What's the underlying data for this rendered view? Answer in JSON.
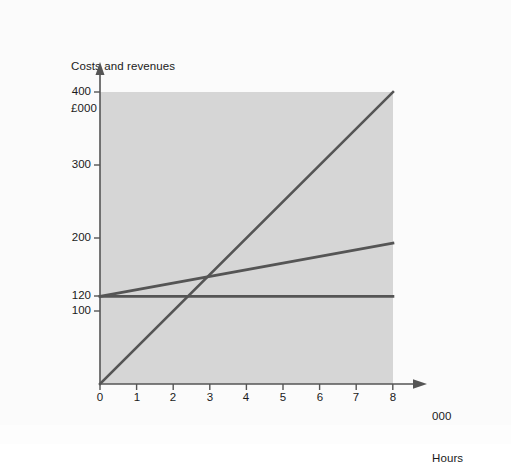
{
  "figure": {
    "background_color": "#fbfbfb",
    "plot_fill_color": "#d6d6d6",
    "line_color": "#555555",
    "axis_color": "#555555",
    "text_color": "#1a1a1a"
  },
  "axis_titles": {
    "y_line1": "Costs and revenues",
    "y_line2": "£000",
    "x_line1": "000",
    "x_line2": "Hours"
  },
  "y_ticks": [
    {
      "label": "400",
      "value": 400
    },
    {
      "label": "300",
      "value": 300
    },
    {
      "label": "200",
      "value": 200
    },
    {
      "label": "120",
      "value": 120
    },
    {
      "label": "100",
      "value": 100
    }
  ],
  "x_ticks": [
    {
      "label": "0",
      "value": 0
    },
    {
      "label": "1",
      "value": 1
    },
    {
      "label": "2",
      "value": 2
    },
    {
      "label": "3",
      "value": 3
    },
    {
      "label": "4",
      "value": 4
    },
    {
      "label": "5",
      "value": 5
    },
    {
      "label": "6",
      "value": 6
    },
    {
      "label": "7",
      "value": 7
    },
    {
      "label": "8",
      "value": 8
    }
  ],
  "chart_data": {
    "type": "line",
    "title": "",
    "subtitle": "",
    "xlabel": "000 Hours",
    "ylabel": "Costs and revenues £000",
    "xlim": [
      0,
      8
    ],
    "ylim": [
      0,
      400
    ],
    "grid": false,
    "legend": "none",
    "shaded_plot_region": {
      "x_range": [
        0,
        8
      ],
      "y_range": [
        0,
        400
      ],
      "color": "#d6d6d6"
    },
    "x": [
      0,
      8
    ],
    "series": [
      {
        "name": "Sales revenue",
        "values": [
          0,
          400
        ],
        "points": [
          [
            0,
            0
          ],
          [
            8,
            400
          ]
        ],
        "slope_per_unit": 50,
        "intercept": 0,
        "color": "#555555"
      },
      {
        "name": "Total cost",
        "values": [
          120,
          193
        ],
        "points": [
          [
            0,
            120
          ],
          [
            8,
            193
          ]
        ],
        "slope_per_unit": 9.1,
        "intercept": 120,
        "color": "#555555"
      },
      {
        "name": "Fixed cost",
        "values": [
          120,
          120
        ],
        "points": [
          [
            0,
            120
          ],
          [
            8,
            120
          ]
        ],
        "slope_per_unit": 0,
        "intercept": 120,
        "color": "#555555"
      }
    ],
    "annotations": [
      {
        "name": "break-even-point",
        "x": 2.55,
        "y": 143,
        "label": ""
      }
    ]
  }
}
